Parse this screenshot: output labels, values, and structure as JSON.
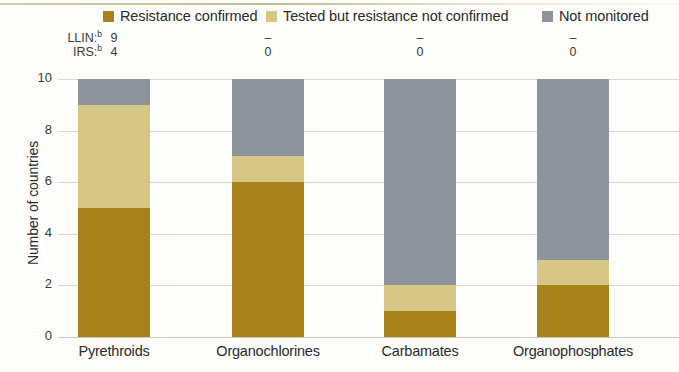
{
  "chart_data": {
    "type": "bar",
    "stacked": true,
    "title": "",
    "subtitle": "",
    "xlabel": "",
    "ylabel": "Number of countries",
    "ylim": [
      0,
      10
    ],
    "yticks": [
      0,
      2,
      4,
      6,
      8,
      10
    ],
    "ytick_labels": [
      "0",
      "2",
      "4",
      "6",
      "8",
      "10"
    ],
    "grid": true,
    "legend_position": "top",
    "categories": [
      "Pyrethroids",
      "Organochlorines",
      "Carbamates",
      "Organophosphates"
    ],
    "series": [
      {
        "name": "Resistance confirmed",
        "color": "#a8821a",
        "values": [
          5,
          6,
          1,
          2
        ]
      },
      {
        "name": "Tested but resistance not confirmed",
        "color": "#d7c786",
        "values": [
          4,
          1,
          1,
          1
        ]
      },
      {
        "name": "Not monitored",
        "color": "#8e949b",
        "values": [
          1,
          3,
          8,
          7
        ]
      }
    ],
    "annotations": {
      "rows": [
        {
          "label": "LLIN:",
          "footnote": "b",
          "values": [
            "9",
            "–",
            "–",
            "–"
          ]
        },
        {
          "label": "IRS:",
          "footnote": "b",
          "values": [
            "4",
            "0",
            "0",
            "0"
          ]
        }
      ]
    }
  },
  "legend": {
    "items": [
      {
        "label": "Resistance confirmed",
        "color": "#a8821a"
      },
      {
        "label": "Tested but resistance not confirmed",
        "color": "#d7c786"
      },
      {
        "label": "Not monitored",
        "color": "#8e949b"
      }
    ]
  },
  "colors": {
    "resistance_confirmed": "#a8821a",
    "tested_not_confirmed": "#d7c786",
    "not_monitored": "#8e949b",
    "grid": "#ddd9cd",
    "text": "#2b2b2b",
    "background": "#fdfdfb"
  }
}
